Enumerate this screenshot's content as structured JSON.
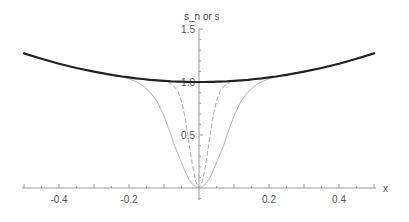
{
  "chart_data": {
    "type": "line",
    "title": "",
    "xlabel": "x",
    "ylabel": "s_n or s",
    "xlim": [
      -0.5,
      0.5
    ],
    "ylim": [
      -0.1,
      1.5
    ],
    "grid": false,
    "legend": null,
    "x_ticks": [
      -0.4,
      -0.2,
      0.2,
      0.4
    ],
    "x_tick_labels": [
      "-0.4",
      "-0.2",
      "0.2",
      "0.4"
    ],
    "y_ticks": [
      0.5,
      1.0,
      1.5
    ],
    "y_tick_labels": [
      "0.5",
      "1.0",
      "1.5"
    ],
    "x": [
      -0.5,
      -0.45,
      -0.4,
      -0.35,
      -0.3,
      -0.25,
      -0.22,
      -0.2,
      -0.18,
      -0.16,
      -0.14,
      -0.12,
      -0.1,
      -0.09,
      -0.08,
      -0.07,
      -0.06,
      -0.05,
      -0.04,
      -0.03,
      -0.02,
      -0.01,
      0,
      0.01,
      0.02,
      0.03,
      0.04,
      0.05,
      0.06,
      0.07,
      0.08,
      0.09,
      0.1,
      0.12,
      0.14,
      0.16,
      0.18,
      0.2,
      0.22,
      0.25,
      0.3,
      0.35,
      0.4,
      0.45,
      0.5
    ],
    "series": [
      {
        "name": "s",
        "style": "thick-black",
        "color": "#222222",
        "values": [
          1.27,
          1.219,
          1.173,
          1.132,
          1.097,
          1.068,
          1.052,
          1.043,
          1.035,
          1.028,
          1.021,
          1.016,
          1.011,
          1.009,
          1.007,
          1.005,
          1.004,
          1.003,
          1.002,
          1.001,
          1.0,
          1.0,
          1.0,
          1.0,
          1.0,
          1.001,
          1.002,
          1.003,
          1.004,
          1.005,
          1.007,
          1.009,
          1.011,
          1.016,
          1.021,
          1.028,
          1.035,
          1.043,
          1.052,
          1.068,
          1.097,
          1.132,
          1.173,
          1.219,
          1.27
        ]
      },
      {
        "name": "s_n (wide)",
        "style": "thin-gray-solid",
        "color": "#b4b4b4",
        "values": [
          1.27,
          1.219,
          1.173,
          1.132,
          1.097,
          1.068,
          1.047,
          1.031,
          1.005,
          0.965,
          0.905,
          0.82,
          0.68,
          0.59,
          0.5,
          0.4,
          0.32,
          0.24,
          0.16,
          0.09,
          0.042,
          0.011,
          0.0,
          0.011,
          0.042,
          0.09,
          0.16,
          0.24,
          0.32,
          0.4,
          0.5,
          0.59,
          0.68,
          0.82,
          0.905,
          0.965,
          1.005,
          1.031,
          1.047,
          1.068,
          1.097,
          1.132,
          1.173,
          1.219,
          1.27
        ]
      },
      {
        "name": "s_n (narrow)",
        "style": "thin-gray-dashed",
        "color": "#a8a8a8",
        "values": [
          1.27,
          1.219,
          1.173,
          1.132,
          1.097,
          1.068,
          1.052,
          1.043,
          1.035,
          1.028,
          1.021,
          1.016,
          1.01,
          1.003,
          0.98,
          0.955,
          0.91,
          0.82,
          0.67,
          0.46,
          0.24,
          0.067,
          0.0,
          0.067,
          0.24,
          0.46,
          0.67,
          0.82,
          0.91,
          0.955,
          0.98,
          1.003,
          1.01,
          1.016,
          1.021,
          1.028,
          1.035,
          1.043,
          1.052,
          1.068,
          1.097,
          1.132,
          1.173,
          1.219,
          1.27
        ]
      }
    ]
  },
  "colors": {
    "axis": "#9a9a9a",
    "tick_label": "#555555"
  }
}
